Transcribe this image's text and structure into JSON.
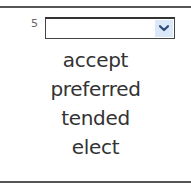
{
  "question": {
    "number": "5",
    "select": {
      "value": "",
      "arrow_icon": "chevron-down-icon",
      "arrow_bg_color": "#dbe8f7"
    },
    "options": [
      {
        "label": "accept"
      },
      {
        "label": "preferred"
      },
      {
        "label": "tended"
      },
      {
        "label": "elect"
      }
    ]
  }
}
